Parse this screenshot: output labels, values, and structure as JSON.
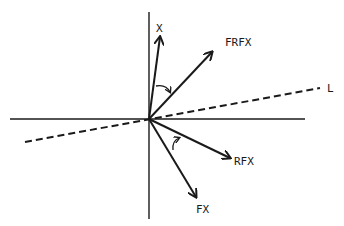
{
  "diagram": {
    "colors": {
      "stroke": "#1a1a1a",
      "background": "#ffffff"
    },
    "axes": {
      "horizontal": true,
      "vertical": true
    },
    "vectors": [
      {
        "id": "x",
        "label": "X"
      },
      {
        "id": "frfx",
        "label": "FRFX"
      },
      {
        "id": "rfx",
        "label": "RFX"
      },
      {
        "id": "fx",
        "label": "FX"
      }
    ],
    "line": {
      "label": "L",
      "style": "dashed"
    },
    "rotation_arrows": [
      {
        "from": "X",
        "to": "FRFX",
        "direction": "clockwise"
      },
      {
        "from": "FX",
        "to": "RFX",
        "direction": "counterclockwise"
      }
    ]
  }
}
